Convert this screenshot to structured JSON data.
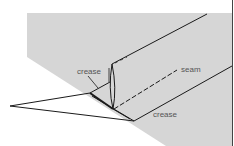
{
  "diagram": {
    "type": "sewing-fold-illustration",
    "colors": {
      "background": "#ffffff",
      "fabric": "#d6d6d6",
      "line": "#1a1a1a",
      "label": "#555555",
      "edge": "#444444"
    },
    "labels": {
      "crease_top": "crease",
      "seam": "seam",
      "crease_bottom": "crease"
    }
  }
}
